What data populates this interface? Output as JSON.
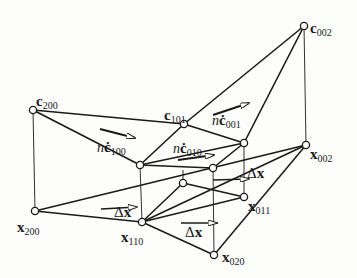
{
  "figure": {
    "colors": {
      "line": "#1a1a1a",
      "node_fill": "#ffffff",
      "background": "#fdfdfc"
    }
  },
  "control_points": [
    {
      "id": "c200",
      "symbol": "c",
      "sub": "200",
      "x": 33,
      "y": 110
    },
    {
      "id": "c101",
      "symbol": "c",
      "sub": "101",
      "x": 184,
      "y": 124
    },
    {
      "id": "c002",
      "symbol": "c",
      "sub": "002",
      "x": 304,
      "y": 26
    },
    {
      "id": "c110",
      "symbol": "",
      "sub": "",
      "x": 140,
      "y": 165
    },
    {
      "id": "c011",
      "symbol": "",
      "sub": "",
      "x": 244,
      "y": 143
    },
    {
      "id": "c020",
      "symbol": "",
      "sub": "",
      "x": 213,
      "y": 168
    }
  ],
  "domain_points": [
    {
      "id": "x200",
      "symbol": "x",
      "sub": "200",
      "x": 35,
      "y": 211
    },
    {
      "id": "x110",
      "symbol": "x",
      "sub": "110",
      "x": 142,
      "y": 222
    },
    {
      "id": "x020",
      "symbol": "x",
      "sub": "020",
      "x": 214,
      "y": 255
    },
    {
      "id": "x011",
      "symbol": "x",
      "sub": "011",
      "x": 244,
      "y": 197
    },
    {
      "id": "x002",
      "symbol": "x",
      "sub": "002",
      "x": 306,
      "y": 145
    },
    {
      "id": "x101",
      "symbol": "",
      "sub": "",
      "x": 183,
      "y": 183
    }
  ],
  "labels": {
    "c200": {
      "sym": "c",
      "sub": "200"
    },
    "c101": {
      "sym": "c",
      "sub": "101"
    },
    "c002": {
      "sym": "c",
      "sub": "002"
    },
    "x200": {
      "sym": "x",
      "sub": "200"
    },
    "x110": {
      "sym": "x",
      "sub": "110"
    },
    "x020": {
      "sym": "x",
      "sub": "020"
    },
    "x011": {
      "sym": "x",
      "sub": "011"
    },
    "x002": {
      "sym": "x",
      "sub": "002"
    },
    "nc100": {
      "n": "n",
      "sym": "ċ",
      "sub": "100"
    },
    "nc010": {
      "n": "n",
      "sym": "ċ",
      "sub": "010"
    },
    "nc001": {
      "n": "n",
      "sym": "ċ",
      "sub": "001"
    },
    "dx1": {
      "delta": "Δ",
      "sym": "x"
    },
    "dx2": {
      "delta": "Δ",
      "sym": "x"
    },
    "dx3": {
      "delta": "Δ",
      "sym": "x"
    }
  }
}
